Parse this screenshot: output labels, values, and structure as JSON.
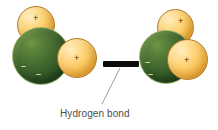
{
  "figure": {
    "background_color": "#ffffff",
    "width": 218,
    "height": 130
  },
  "colors": {
    "oxygen": "#43692f",
    "hydrogen": "#fccd69",
    "bond": "#0b0b0b",
    "leader_line": "#9a9a9a",
    "label_text": "#4c4c4c",
    "plus_sign": "#4a3206",
    "minus_sign": "#c7d9a4"
  },
  "molecules": [
    {
      "id": "water-left",
      "name": "water-molecule-left",
      "atoms": [
        {
          "id": "o-left",
          "element": "oxygen",
          "charge": "-",
          "charge_count": 2,
          "x": 12,
          "y": 27,
          "size": 58
        },
        {
          "id": "h-left-top",
          "element": "hydrogen",
          "charge": "+",
          "charge_count": 1,
          "x": 17,
          "y": 6,
          "size": 38
        },
        {
          "id": "h-left-right",
          "element": "hydrogen",
          "charge": "+",
          "charge_count": 1,
          "x": 57,
          "y": 38,
          "size": 40
        }
      ]
    },
    {
      "id": "water-right",
      "name": "water-molecule-right",
      "atoms": [
        {
          "id": "o-right",
          "element": "oxygen",
          "charge": "-",
          "charge_count": 2,
          "x": 139,
          "y": 30,
          "size": 54
        },
        {
          "id": "h-right-top",
          "element": "hydrogen",
          "charge": "+",
          "charge_count": 1,
          "x": 157,
          "y": 9,
          "size": 37
        },
        {
          "id": "h-right-lower",
          "element": "hydrogen",
          "charge": "+",
          "charge_count": 1,
          "x": 167,
          "y": 39,
          "size": 41
        }
      ]
    }
  ],
  "bond": {
    "label": "Hydrogen bond",
    "bar": {
      "x": 103,
      "y": 61,
      "width": 36,
      "height": 6
    },
    "leader": {
      "x1": 120,
      "y1": 68,
      "x2": 102,
      "y2": 104
    },
    "label_position": {
      "x": 60,
      "y": 108
    }
  },
  "charge_symbols": {
    "positive": "+",
    "negative": "–"
  }
}
